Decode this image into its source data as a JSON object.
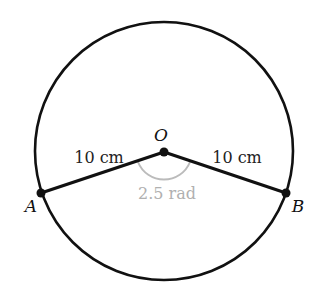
{
  "diagram": {
    "title": "",
    "center_label": "O",
    "point_a_label": "A",
    "point_b_label": "B",
    "radius_left_label": "10 cm",
    "radius_right_label": "10 cm",
    "angle_label": "2.5 rad",
    "colors": {
      "stroke": "#111111",
      "angle_arc": "#bbbbbb",
      "angle_text": "#b0b0b0",
      "background": "#ffffff"
    }
  }
}
